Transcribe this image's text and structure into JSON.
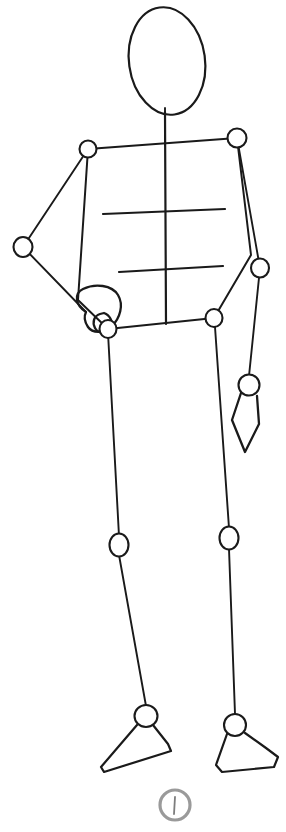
{
  "canvas": {
    "width": 286,
    "height": 832,
    "background_color": "#ffffff",
    "ink_color": "#1a1a1a",
    "mark_color": "#9a9a9a",
    "title": "Gesture mannequin stick figure sketch"
  },
  "figure": {
    "head": {
      "label": "head-oval",
      "cx": 167,
      "cy": 61,
      "rx": 38,
      "ry": 54,
      "rotation": -8
    },
    "neck": {
      "label": "neck-line",
      "x1": 165,
      "y1": 108,
      "x2": 165,
      "y2": 145
    },
    "spine": {
      "label": "spine-line",
      "x1": 165,
      "y1": 112,
      "x2": 166,
      "y2": 324
    },
    "shoulder_line": {
      "label": "shoulder-line",
      "x1": 88,
      "y1": 149,
      "x2": 237,
      "y2": 138
    },
    "hip_line": {
      "label": "hip-line",
      "x1": 108,
      "y1": 329,
      "x2": 214,
      "y2": 318
    },
    "chest_line": {
      "label": "chest-guide-line",
      "x1": 103,
      "y1": 214,
      "x2": 225,
      "y2": 209
    },
    "waist_line": {
      "label": "waist-guide-line",
      "x1": 119,
      "y1": 272,
      "x2": 223,
      "y2": 266
    },
    "torso_left_edge": {
      "label": "torso-left-edge",
      "points": "88,149 78,300 108,329"
    },
    "torso_right_edge": {
      "label": "torso-right-edge",
      "points": "237,138 251,255 214,318"
    },
    "joints": [
      {
        "name": "shoulder-left-joint",
        "cx": 88,
        "cy": 149,
        "rx": 8.5,
        "ry": 8.5
      },
      {
        "name": "shoulder-right-joint",
        "cx": 237,
        "cy": 138,
        "rx": 9.5,
        "ry": 9.5
      },
      {
        "name": "elbow-left-joint",
        "cx": 23,
        "cy": 247,
        "rx": 9.5,
        "ry": 10
      },
      {
        "name": "elbow-right-joint",
        "cx": 260,
        "cy": 268,
        "rx": 9,
        "ry": 9.5
      },
      {
        "name": "wrist-right-joint",
        "cx": 249,
        "cy": 385,
        "rx": 10.5,
        "ry": 10.5
      },
      {
        "name": "hip-left-joint",
        "cx": 108,
        "cy": 329,
        "rx": 8.5,
        "ry": 9
      },
      {
        "name": "hip-right-joint",
        "cx": 214,
        "cy": 318,
        "rx": 8.5,
        "ry": 9
      },
      {
        "name": "knee-left-joint",
        "cx": 119,
        "cy": 545,
        "rx": 9.5,
        "ry": 11.5
      },
      {
        "name": "knee-right-joint",
        "cx": 229,
        "cy": 538,
        "rx": 9.5,
        "ry": 11.5
      },
      {
        "name": "ankle-left-joint",
        "cx": 146,
        "cy": 716,
        "rx": 11.5,
        "ry": 11
      },
      {
        "name": "ankle-right-joint",
        "cx": 235,
        "cy": 725,
        "rx": 11,
        "ry": 11
      }
    ],
    "limbs": [
      {
        "name": "upper-arm-left",
        "x1": 88,
        "y1": 149,
        "x2": 23,
        "y2": 247
      },
      {
        "name": "forearm-left",
        "x1": 23,
        "y1": 247,
        "x2": 86,
        "y2": 312
      },
      {
        "name": "upper-arm-right",
        "x1": 237,
        "y1": 138,
        "x2": 260,
        "y2": 268
      },
      {
        "name": "forearm-right",
        "x1": 260,
        "y1": 268,
        "x2": 249,
        "y2": 376
      },
      {
        "name": "thigh-left",
        "x1": 108,
        "y1": 333,
        "x2": 119,
        "y2": 536
      },
      {
        "name": "shin-left",
        "x1": 119,
        "y1": 555,
        "x2": 146,
        "y2": 706
      },
      {
        "name": "thigh-right",
        "x1": 215,
        "y1": 327,
        "x2": 229,
        "y2": 528
      },
      {
        "name": "shin-right",
        "x1": 229,
        "y1": 549,
        "x2": 235,
        "y2": 714
      }
    ],
    "hand_left": {
      "label": "hand-left-blob",
      "outline": "M 86,312 C 76,306 73,294 83,289 C 95,283 112,285 118,295 C 124,305 120,318 112,326 C 104,334 92,333 88,327 C 84,321 84,316 86,312 Z",
      "thumb": "M 100,314 C 94,316 92,322 95,328 C 98,334 108,334 111,329 C 114,323 110,315 104,313 Z"
    },
    "hand_right": {
      "label": "hand-right-diamond",
      "outline": "M 241,393 L 232,420 L 245,452 L 259,424 L 257,396"
    },
    "foot_left": {
      "label": "foot-left-shape",
      "outline": "M 137,725 L 101,767 L 104,772 L 171,751 L 168,744 L 153,725"
    },
    "foot_right": {
      "label": "foot-right-shape",
      "outline": "M 227,734 L 216,765 L 222,772 L 274,767 L 278,757 L 266,748 L 245,733"
    }
  },
  "page_mark": {
    "label": "page-number-circle-mark",
    "cx": 175,
    "cy": 805,
    "r": 15,
    "tick": {
      "x1": 175,
      "y1": 797,
      "x2": 174,
      "y2": 814
    },
    "color": "#9a9a9a"
  }
}
